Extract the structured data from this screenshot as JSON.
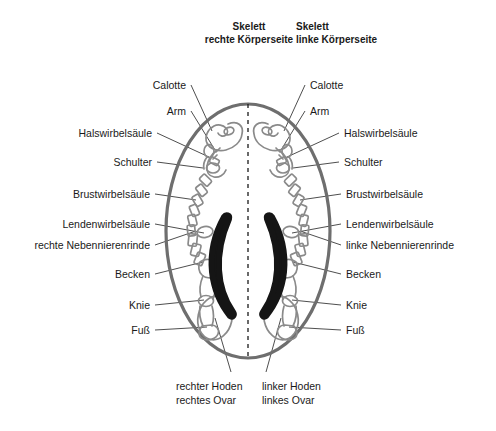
{
  "titles": {
    "right_side": "Skelett\nrechte Körperseite",
    "left_side": "Skelett\nlinke Körperseite"
  },
  "labels_right_body_column": [
    {
      "text": "Calotte",
      "x": 118,
      "y": 79,
      "right": 186,
      "leader_to_x": 212,
      "leader_to_y": 131
    },
    {
      "text": "Arm",
      "x": 118,
      "y": 105,
      "right": 186,
      "leader_to_x": 215,
      "leader_to_y": 150
    },
    {
      "text": "Halswirbelsäule",
      "x": 40,
      "y": 127,
      "right": 152,
      "leader_to_x": 209,
      "leader_to_y": 157
    },
    {
      "text": "Schulter",
      "x": 60,
      "y": 156,
      "right": 152,
      "leader_to_x": 203,
      "leader_to_y": 168
    },
    {
      "text": "Brustwirbelsäule",
      "x": 24,
      "y": 188,
      "right": 150,
      "leader_to_x": 196,
      "leader_to_y": 200
    },
    {
      "text": "Lendenwirbelsäule",
      "x": 16,
      "y": 218,
      "right": 150,
      "leader_to_x": 204,
      "leader_to_y": 233
    },
    {
      "text": "rechte Nebennierenrinde",
      "x": 8,
      "y": 239,
      "right": 150,
      "leader_to_x": 196,
      "leader_to_y": 231
    },
    {
      "text": "Becken",
      "x": 68,
      "y": 268,
      "right": 150,
      "leader_to_x": 203,
      "leader_to_y": 262
    },
    {
      "text": "Knie",
      "x": 84,
      "y": 299,
      "right": 150,
      "leader_to_x": 204,
      "leader_to_y": 300
    },
    {
      "text": "Fuß",
      "x": 92,
      "y": 324,
      "right": 150,
      "leader_to_x": 207,
      "leader_to_y": 327
    }
  ],
  "labels_left_body_column": [
    {
      "text": "Calotte",
      "x": 310,
      "y": 79,
      "leader_to_x": 284,
      "leader_to_y": 131
    },
    {
      "text": "Arm",
      "x": 310,
      "y": 105,
      "leader_to_x": 281,
      "leader_to_y": 150
    },
    {
      "text": "Halswirbelsäule",
      "x": 344,
      "y": 127,
      "leader_to_x": 287,
      "leader_to_y": 157
    },
    {
      "text": "Schulter",
      "x": 344,
      "y": 156,
      "leader_to_x": 293,
      "leader_to_y": 168
    },
    {
      "text": "Brustwirbelsäule",
      "x": 346,
      "y": 188,
      "leader_to_x": 300,
      "leader_to_y": 200
    },
    {
      "text": "Lendenwirbelsäule",
      "x": 346,
      "y": 218,
      "leader_to_x": 292,
      "leader_to_y": 233
    },
    {
      "text": "linke Nebennierenrinde",
      "x": 346,
      "y": 239,
      "leader_to_x": 300,
      "leader_to_y": 231
    },
    {
      "text": "Becken",
      "x": 346,
      "y": 268,
      "leader_to_x": 293,
      "leader_to_y": 262
    },
    {
      "text": "Knie",
      "x": 346,
      "y": 299,
      "leader_to_x": 292,
      "leader_to_y": 300
    },
    {
      "text": "Fuß",
      "x": 346,
      "y": 324,
      "leader_to_x": 289,
      "leader_to_y": 327
    }
  ],
  "labels_bottom": [
    {
      "text": "rechter Hoden\nrechtes Ovar",
      "x": 176,
      "y": 380,
      "leader_from_x": 231,
      "leader_from_y": 372,
      "leader_to_x": 215,
      "leader_to_y": 318
    },
    {
      "text": "linker Hoden\nlinkes Ovar",
      "x": 262,
      "y": 380,
      "leader_from_x": 266,
      "leader_from_y": 372,
      "leader_to_x": 281,
      "leader_to_y": 318
    }
  ],
  "figure": {
    "type": "body-cross-section-skeleton-scintigram",
    "outline_shape": "oval",
    "center_x": 248,
    "center_y": 231,
    "oval_rx": 82,
    "oval_ry": 127,
    "midline_style": "dashed",
    "structures_right_half": [
      "Calotte",
      "Arm",
      "Halswirbelsäule",
      "Schulter",
      "Brustwirbelsäule",
      "Lendenwirbelsäule",
      "rechte Nebennierenrinde",
      "Becken",
      "Knie",
      "Fuß",
      "rechter Hoden / rechtes Ovar"
    ],
    "structures_left_half": [
      "Calotte",
      "Arm",
      "Halswirbelsäule",
      "Schulter",
      "Brustwirbelsäule",
      "Lendenwirbelsäule",
      "linke Nebennierenrinde",
      "Becken",
      "Knie",
      "Fuß",
      "linker Hoden / linkes Ovar"
    ]
  },
  "colors": {
    "background": "#ffffff",
    "text": "#1a1a1a",
    "oval_outline": "#6e6e6e",
    "bone_outline": "#8a8a8a",
    "organ_fill_dark": "#151515",
    "leader_line": "#3a3a3a",
    "midline": "#1a1a1a"
  }
}
